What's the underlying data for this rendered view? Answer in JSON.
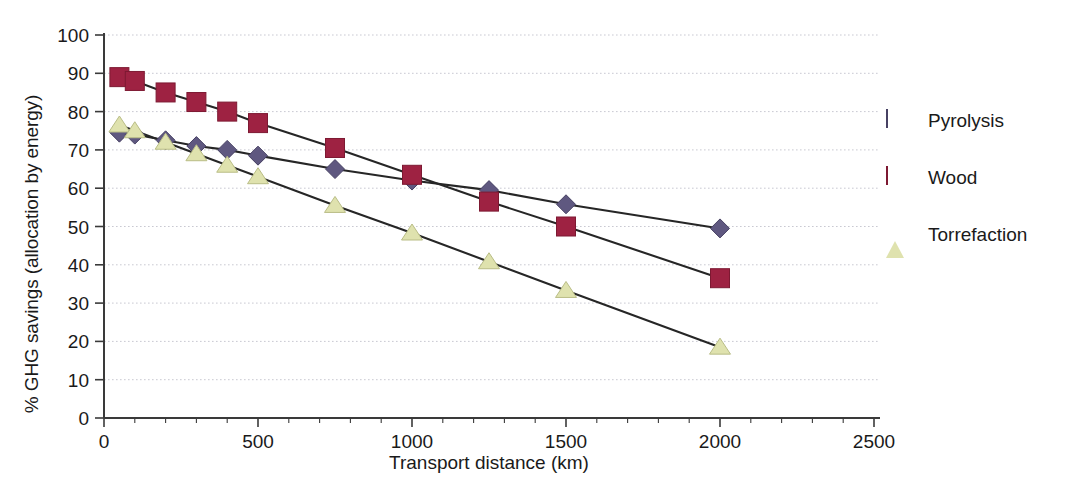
{
  "chart_data": {
    "type": "line",
    "title": "",
    "xlabel": "Transport distance (km)",
    "ylabel": "% GHG savings (allocation by energy)",
    "xlim": [
      0,
      2500
    ],
    "ylim": [
      0,
      100
    ],
    "xticks": [
      0,
      500,
      1000,
      1500,
      2000,
      2500
    ],
    "yticks": [
      0,
      10,
      20,
      30,
      40,
      50,
      60,
      70,
      80,
      90,
      100
    ],
    "xtick_labels": [
      "0",
      "500",
      "1000",
      "1500",
      "2000",
      "2500"
    ],
    "ytick_labels": [
      "0",
      "10",
      "20",
      "30",
      "40",
      "50",
      "60",
      "70",
      "80",
      "90",
      "100"
    ],
    "x_minor_tick_step": 100,
    "grid": "horizontal-dotted",
    "legend_position": "right",
    "x": [
      50,
      100,
      200,
      300,
      400,
      500,
      750,
      1000,
      1250,
      1500,
      2000
    ],
    "series": [
      {
        "name": "Pyrolysis",
        "marker": "diamond",
        "color": "#5f5880",
        "values": [
          74.5,
          74.0,
          72.5,
          71.0,
          70.0,
          68.5,
          65.0,
          62.0,
          59.5,
          55.8,
          49.5
        ]
      },
      {
        "name": "Wood",
        "marker": "square",
        "color": "#9e2242",
        "values": [
          89.0,
          88.0,
          85.0,
          82.5,
          80.0,
          77.0,
          70.5,
          63.5,
          56.5,
          50.0,
          36.5
        ]
      },
      {
        "name": "Torrefaction",
        "marker": "triangle",
        "color": "#dfe2ae",
        "values": [
          76.5,
          75.0,
          72.0,
          69.0,
          66.0,
          63.0,
          55.5,
          48.3,
          40.8,
          33.3,
          18.5
        ]
      }
    ]
  },
  "legend": {
    "items": [
      {
        "label": "Pyrolysis"
      },
      {
        "label": "Wood"
      },
      {
        "label": "Torrefaction"
      }
    ]
  },
  "colors": {
    "pyrolysis": "#5f5880",
    "pyrolysis_edge": "#474163",
    "wood": "#9e2242",
    "wood_edge": "#7d1932",
    "torrefaction": "#dfe2ae",
    "torrefaction_edge": "#b9bd86",
    "axis": "#3a3a3a",
    "gridline": "#c9c9d2",
    "connector": "#262626",
    "background": "#ffffff"
  }
}
